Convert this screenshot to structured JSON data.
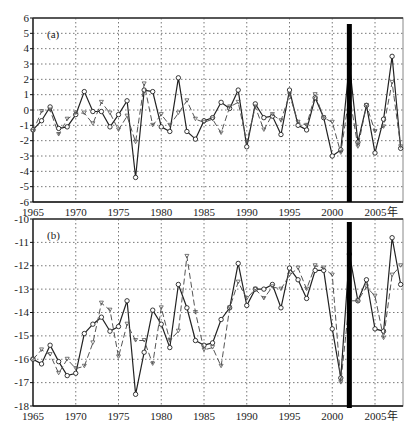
{
  "chart_data": [
    {
      "type": "line",
      "panel_label": "(a)",
      "xlabel": "",
      "ylabel": "",
      "x_unit_suffix": "年",
      "x": [
        1965,
        1966,
        1967,
        1968,
        1969,
        1970,
        1971,
        1972,
        1973,
        1974,
        1975,
        1976,
        1977,
        1978,
        1979,
        1980,
        1981,
        1982,
        1983,
        1984,
        1985,
        1986,
        1987,
        1988,
        1989,
        1990,
        1991,
        1992,
        1993,
        1994,
        1995,
        1996,
        1997,
        1998,
        1999,
        2000,
        2001,
        2002,
        2003,
        2004,
        2005,
        2006,
        2007,
        2008
      ],
      "xlim": [
        1965,
        2008
      ],
      "xticks": [
        1965,
        1970,
        1975,
        1980,
        1985,
        1990,
        1995,
        2000,
        2005
      ],
      "xtick_labels": [
        "1965",
        "1970",
        "1975",
        "1980",
        "1985",
        "1990",
        "1995",
        "2000",
        "2005年"
      ],
      "ylim": [
        -6,
        6
      ],
      "yticks": [
        -6,
        -5,
        -4,
        -3,
        -2,
        -1,
        0,
        1,
        2,
        3,
        4,
        5,
        6
      ],
      "grid": true,
      "series": [
        {
          "name": "observed",
          "style": "solid-circle",
          "values": [
            -1.3,
            -0.7,
            0.2,
            -1.2,
            -1.1,
            -0.3,
            1.2,
            -0.1,
            -0.1,
            -1.1,
            -0.3,
            0.6,
            -4.4,
            1.3,
            1.2,
            -1.1,
            -1.4,
            2.1,
            -1.4,
            -1.9,
            -0.7,
            -0.5,
            0.5,
            0.1,
            1.3,
            -2.4,
            0.4,
            -0.5,
            -0.4,
            -1.6,
            1.3,
            -1.0,
            -1.3,
            0.8,
            -0.5,
            -3.0,
            -2.6,
            3.0,
            -2.1,
            0.3,
            -2.8,
            -0.6,
            3.5,
            -2.5
          ]
        },
        {
          "name": "simulated",
          "style": "dashed-triangle",
          "values": [
            -1.4,
            -0.1,
            0.0,
            -1.6,
            -0.6,
            -0.2,
            -0.2,
            -0.9,
            0.5,
            -0.2,
            -1.3,
            -0.4,
            -2.1,
            1.7,
            -1.0,
            -0.3,
            -1.0,
            -0.2,
            0.6,
            -0.6,
            -0.8,
            -0.6,
            -1.5,
            0.2,
            0.5,
            -2.1,
            0.2,
            -1.3,
            -0.3,
            -0.7,
            1.0,
            -0.8,
            -1.0,
            1.0,
            -0.5,
            -0.8,
            -2.8,
            1.0,
            -2.4,
            0.3,
            -1.4,
            -1.1,
            1.8,
            -2.4
          ]
        }
      ],
      "annotation_bar_x": 2002
    },
    {
      "type": "line",
      "panel_label": "(b)",
      "xlabel": "",
      "ylabel": "",
      "x_unit_suffix": "年",
      "x": [
        1965,
        1966,
        1967,
        1968,
        1969,
        1970,
        1971,
        1972,
        1973,
        1974,
        1975,
        1976,
        1977,
        1978,
        1979,
        1980,
        1981,
        1982,
        1983,
        1984,
        1985,
        1986,
        1987,
        1988,
        1989,
        1990,
        1991,
        1992,
        1993,
        1994,
        1995,
        1996,
        1997,
        1998,
        1999,
        2000,
        2001,
        2002,
        2003,
        2004,
        2005,
        2006,
        2007,
        2008
      ],
      "xlim": [
        1965,
        2008
      ],
      "xticks": [
        1965,
        1970,
        1975,
        1980,
        1985,
        1990,
        1995,
        2000,
        2005
      ],
      "xtick_labels": [
        "1965",
        "1970",
        "1975",
        "1980",
        "1985",
        "1990",
        "1995",
        "2000",
        "2005年"
      ],
      "ylim": [
        -18,
        -10
      ],
      "yticks": [
        -18,
        -17,
        -16,
        -15,
        -14,
        -13,
        -12,
        -11,
        -10
      ],
      "grid": true,
      "series": [
        {
          "name": "observed",
          "style": "solid-circle",
          "values": [
            -16.0,
            -16.2,
            -15.4,
            -16.1,
            -16.7,
            -16.6,
            -14.9,
            -14.5,
            -14.2,
            -14.8,
            -14.6,
            -13.5,
            -17.5,
            -15.7,
            -13.9,
            -14.5,
            -15.5,
            -12.8,
            -13.8,
            -15.2,
            -15.4,
            -15.3,
            -14.3,
            -13.8,
            -11.9,
            -13.7,
            -13.0,
            -13.0,
            -12.8,
            -13.8,
            -12.1,
            -12.6,
            -13.4,
            -12.2,
            -12.2,
            -14.7,
            -16.8,
            -11.5,
            -13.5,
            -12.6,
            -14.7,
            -14.8,
            -10.8,
            -12.8
          ]
        },
        {
          "name": "simulated",
          "style": "dashed-triangle",
          "values": [
            -16.0,
            -15.6,
            -15.8,
            -16.6,
            -16.0,
            -16.4,
            -16.3,
            -15.3,
            -13.6,
            -13.9,
            -15.9,
            -14.5,
            -15.2,
            -15.2,
            -16.2,
            -13.8,
            -15.2,
            -14.8,
            -11.6,
            -14.0,
            -15.6,
            -15.5,
            -16.3,
            -13.8,
            -12.7,
            -13.4,
            -13.0,
            -13.4,
            -12.9,
            -13.0,
            -12.4,
            -12.1,
            -13.0,
            -12.0,
            -12.1,
            -12.4,
            -17.0,
            -13.5,
            -13.5,
            -12.9,
            -13.3,
            -15.1,
            -12.4,
            -12.0
          ]
        }
      ],
      "annotation_bar_x": 2002
    }
  ]
}
